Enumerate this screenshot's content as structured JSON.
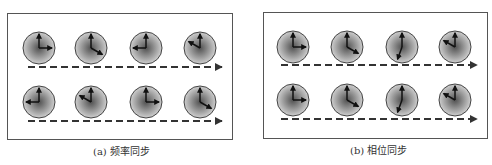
{
  "figure": {
    "panels": [
      {
        "id": "a",
        "caption": "(a) 频率同步",
        "frame": {
          "x": 7,
          "y": 13,
          "w": 226,
          "h": 127
        },
        "caption_pos": {
          "x": 93,
          "y": 143
        },
        "rows": [
          {
            "clock_y": 48,
            "arrow": {
              "x1": 28,
              "x2": 222,
              "y": 67
            },
            "clocks": [
              {
                "cx": 39,
                "hand_angle_deg": 90
              },
              {
                "cx": 91,
                "hand_angle_deg": 120
              },
              {
                "cx": 146,
                "hand_angle_deg": 270
              },
              {
                "cx": 200,
                "hand_angle_deg": 300
              }
            ]
          },
          {
            "clock_y": 102,
            "arrow": {
              "x1": 28,
              "x2": 222,
              "y": 121
            },
            "clocks": [
              {
                "cx": 39,
                "hand_angle_deg": 270
              },
              {
                "cx": 91,
                "hand_angle_deg": 300
              },
              {
                "cx": 146,
                "hand_angle_deg": 90
              },
              {
                "cx": 200,
                "hand_angle_deg": 120
              }
            ]
          }
        ]
      },
      {
        "id": "b",
        "caption": "(b) 相位同步",
        "frame": {
          "x": 263,
          "y": 12,
          "w": 225,
          "h": 127
        },
        "caption_pos": {
          "x": 350,
          "y": 142
        },
        "rows": [
          {
            "clock_y": 47,
            "arrow": {
              "x1": 281,
              "x2": 477,
              "y": 65
            },
            "clocks": [
              {
                "cx": 293,
                "hand_angle_deg": 90
              },
              {
                "cx": 347,
                "hand_angle_deg": 120
              },
              {
                "cx": 402,
                "hand_angle_deg": 200
              },
              {
                "cx": 455,
                "hand_angle_deg": 300
              }
            ]
          },
          {
            "clock_y": 100,
            "arrow": {
              "x1": 281,
              "x2": 477,
              "y": 119
            },
            "clocks": [
              {
                "cx": 293,
                "hand_angle_deg": 90
              },
              {
                "cx": 347,
                "hand_angle_deg": 120
              },
              {
                "cx": 402,
                "hand_angle_deg": 200
              },
              {
                "cx": 455,
                "hand_angle_deg": 300
              }
            ]
          }
        ]
      }
    ],
    "clock_style": {
      "radius": 16,
      "fixed_hand_angle_deg": 0,
      "fixed_hand_length": 14,
      "moving_hand_length": 13,
      "face_center_color": "#505050",
      "face_edge_color": "#cfcfcf",
      "rim_color": "#444444",
      "hand_color": "#111111"
    },
    "arrow_style": {
      "color": "#333333",
      "dash": "7 4",
      "width": 2
    }
  }
}
